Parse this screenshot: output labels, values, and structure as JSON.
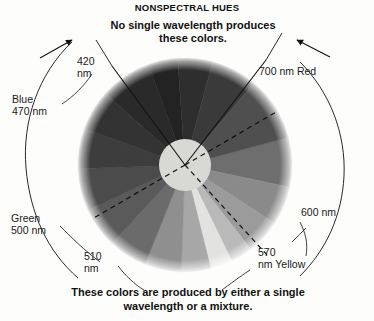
{
  "title": "NONSPECTRAL HUES",
  "top_caption": "No single wavelength\nproduces these colors.",
  "bottom_caption": "These colors are produced by either\na single wavelength or a mixture.",
  "labels": {
    "nm420": "420\nnm",
    "nm700": "700 nm Red",
    "blue470": "Blue\n470 nm",
    "green500": "Green\n500 nm",
    "nm600": "600 nm",
    "nm510": "510\nnm",
    "nm570": "570\nnm Yellow"
  },
  "chart_data": {
    "type": "pie",
    "title": "NONSPECTRAL HUES",
    "subtitle": "No single wavelength produces these colors.",
    "footnote": "These colors are produced by either a single wavelength or a mixture.",
    "center": [
      185,
      165
    ],
    "radius": 107,
    "hub_radius": 26,
    "hub_color": "#d8d8d4",
    "legend_position": "around-wheel",
    "grid": false,
    "categories": [
      "700 nm Red",
      "red-orange",
      "orange",
      "600 nm",
      "yellow-orange",
      "570 nm Yellow",
      "yellow-green",
      "green",
      "500 nm Green",
      "510 nm",
      "blue-green",
      "blue",
      "470 nm Blue",
      "420 nm violet",
      "violet-purple",
      "purple",
      "magenta",
      "red-magenta"
    ],
    "segments": [
      {
        "label": "700 nm Red",
        "start_deg": -15,
        "end_deg": 12,
        "color": "#6e6e6e"
      },
      {
        "label": "red-orange",
        "start_deg": 12,
        "end_deg": 33,
        "color": "#8a8a8a"
      },
      {
        "label": "orange",
        "start_deg": 33,
        "end_deg": 52,
        "color": "#9b9b9b"
      },
      {
        "label": "yellow-orange",
        "start_deg": 52,
        "end_deg": 64,
        "color": "#b9b9b9"
      },
      {
        "label": "570 nm Yellow",
        "start_deg": 64,
        "end_deg": 76,
        "color": "#e2e2e0"
      },
      {
        "label": "yellow-green",
        "start_deg": 76,
        "end_deg": 92,
        "color": "#a7a7a7"
      },
      {
        "label": "green",
        "start_deg": 92,
        "end_deg": 112,
        "color": "#8f8f8f"
      },
      {
        "label": "500 nm Green",
        "start_deg": 112,
        "end_deg": 133,
        "color": "#6b6b6b"
      },
      {
        "label": "510 nm",
        "start_deg": 133,
        "end_deg": 155,
        "color": "#5a5a5a"
      },
      {
        "label": "blue-green",
        "start_deg": 155,
        "end_deg": 178,
        "color": "#4b4b4b"
      },
      {
        "label": "blue",
        "start_deg": 178,
        "end_deg": 200,
        "color": "#3d3d3d"
      },
      {
        "label": "470 nm Blue",
        "start_deg": 200,
        "end_deg": 222,
        "color": "#333333"
      },
      {
        "label": "420 nm violet",
        "start_deg": 222,
        "end_deg": 250,
        "color": "#2a2a2a"
      },
      {
        "label": "violet-purple",
        "start_deg": 250,
        "end_deg": 266,
        "color": "#232323"
      },
      {
        "label": "purple",
        "start_deg": 266,
        "end_deg": 285,
        "color": "#2e2e2e"
      },
      {
        "label": "magenta",
        "start_deg": 285,
        "end_deg": 310,
        "color": "#3a3a3a"
      },
      {
        "label": "red-magenta",
        "start_deg": 310,
        "end_deg": 345,
        "color": "#4f4f4f"
      }
    ],
    "annotations": [
      {
        "name": "nonspectral-wedge",
        "from_deg": 250,
        "to_deg": 345,
        "note": "wedge bounded by the two solid radii — non-spectral purples"
      },
      {
        "name": "dashed-axis",
        "deg": 30,
        "opposite_deg": 210,
        "note": "dashed line across wheel from upper-right to lower-left"
      },
      {
        "name": "dashed-axis-2",
        "deg": 68,
        "note": "dashed line toward yellow"
      }
    ]
  }
}
